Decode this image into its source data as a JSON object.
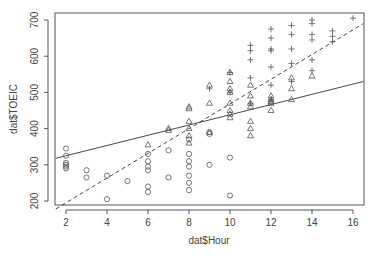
{
  "chart_data": {
    "type": "scatter",
    "title": "",
    "xlabel": "dat$Hour",
    "ylabel": "dat$TOEIC",
    "xlim": [
      1.5,
      16.5
    ],
    "ylim": [
      185,
      720
    ],
    "xticks": [
      2,
      4,
      6,
      8,
      10,
      12,
      14,
      16
    ],
    "yticks": [
      200,
      300,
      400,
      500,
      600,
      700
    ],
    "grid": false,
    "legend": null,
    "series": [
      {
        "name": "group-circle",
        "marker": "o",
        "points": [
          [
            2,
            345
          ],
          [
            2,
            325
          ],
          [
            2,
            305
          ],
          [
            2,
            300
          ],
          [
            2,
            295
          ],
          [
            2,
            290
          ],
          [
            3,
            285
          ],
          [
            3,
            265
          ],
          [
            4,
            270
          ],
          [
            4,
            205
          ],
          [
            5,
            255
          ],
          [
            6,
            330
          ],
          [
            6,
            310
          ],
          [
            6,
            295
          ],
          [
            6,
            285
          ],
          [
            6,
            240
          ],
          [
            6,
            225
          ],
          [
            7,
            340
          ],
          [
            7,
            265
          ],
          [
            8,
            370
          ],
          [
            8,
            330
          ],
          [
            8,
            310
          ],
          [
            8,
            295
          ],
          [
            8,
            270
          ],
          [
            8,
            250
          ],
          [
            8,
            230
          ],
          [
            9,
            390
          ],
          [
            9,
            385
          ],
          [
            9,
            300
          ],
          [
            10,
            320
          ],
          [
            10,
            215
          ]
        ]
      },
      {
        "name": "group-triangle",
        "marker": "triangle",
        "points": [
          [
            6,
            355
          ],
          [
            7,
            400
          ],
          [
            7,
            395
          ],
          [
            8,
            460
          ],
          [
            8,
            455
          ],
          [
            8,
            420
          ],
          [
            8,
            400
          ],
          [
            8,
            380
          ],
          [
            8,
            360
          ],
          [
            9,
            520
          ],
          [
            9,
            470
          ],
          [
            9,
            390
          ],
          [
            10,
            555
          ],
          [
            10,
            530
          ],
          [
            10,
            510
          ],
          [
            10,
            500
          ],
          [
            10,
            470
          ],
          [
            10,
            450
          ],
          [
            10,
            440
          ],
          [
            10,
            430
          ],
          [
            11,
            520
          ],
          [
            11,
            490
          ],
          [
            11,
            470
          ],
          [
            11,
            460
          ],
          [
            11,
            420
          ],
          [
            11,
            400
          ],
          [
            11,
            380
          ],
          [
            12,
            490
          ],
          [
            12,
            480
          ],
          [
            12,
            475
          ],
          [
            12,
            470
          ],
          [
            12,
            450
          ],
          [
            13,
            540
          ],
          [
            13,
            510
          ],
          [
            13,
            480
          ],
          [
            14,
            545
          ]
        ]
      },
      {
        "name": "group-plus",
        "marker": "+",
        "points": [
          [
            9,
            510
          ],
          [
            10,
            555
          ],
          [
            10,
            500
          ],
          [
            11,
            630
          ],
          [
            11,
            615
          ],
          [
            11,
            590
          ],
          [
            11,
            540
          ],
          [
            11,
            470
          ],
          [
            12,
            675
          ],
          [
            12,
            650
          ],
          [
            12,
            620
          ],
          [
            12,
            615
          ],
          [
            12,
            570
          ],
          [
            12,
            520
          ],
          [
            12,
            480
          ],
          [
            13,
            685
          ],
          [
            13,
            660
          ],
          [
            13,
            620
          ],
          [
            13,
            580
          ],
          [
            13,
            530
          ],
          [
            14,
            700
          ],
          [
            14,
            690
          ],
          [
            14,
            660
          ],
          [
            14,
            645
          ],
          [
            14,
            590
          ],
          [
            14,
            560
          ],
          [
            15,
            670
          ],
          [
            15,
            655
          ],
          [
            15,
            640
          ],
          [
            16,
            705
          ]
        ]
      }
    ],
    "lines": [
      {
        "name": "solid-fit",
        "style": "solid",
        "from": [
          1.5,
          318
        ],
        "to": [
          16.5,
          530
        ]
      },
      {
        "name": "dashed-fit",
        "style": "dashed",
        "from": [
          1.5,
          178
        ],
        "to": [
          16.5,
          690
        ]
      }
    ]
  }
}
